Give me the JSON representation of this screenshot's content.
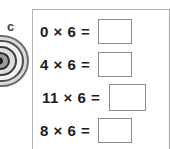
{
  "decor": {
    "letter": "c",
    "spiral_icon": "spiral-shell-icon",
    "spiral_color": "#8f8f8f"
  },
  "panel": {
    "border_color": "#b4b4b4",
    "background": "#ffffff",
    "box_border_color": "#8c8c8c",
    "rows": [
      {
        "expression": "0 × 6 =",
        "answer": "",
        "answer_placeholder": ""
      },
      {
        "expression": "4 × 6 =",
        "answer": "",
        "answer_placeholder": ""
      },
      {
        "expression": "11 × 6 =",
        "answer": "",
        "answer_placeholder": ""
      },
      {
        "expression": "8 × 6 =",
        "answer": "",
        "answer_placeholder": ""
      }
    ]
  }
}
